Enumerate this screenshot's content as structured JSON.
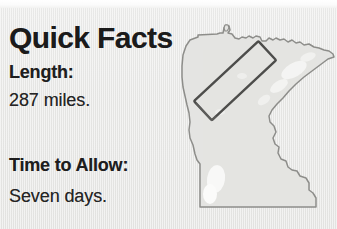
{
  "page": {
    "background_color": "#e9e9e7",
    "width": 337,
    "height": 229
  },
  "sidebar_panel": {
    "title": "Quick Facts",
    "fields": [
      {
        "label": "Length:",
        "value": "287 miles."
      },
      {
        "label": "Time to Allow:",
        "value": "Seven days."
      }
    ]
  },
  "map": {
    "name": "minnesota-state-outline",
    "fill_color": "#e4e4e2",
    "stroke_color": "#8a8a87",
    "highlight_box": {
      "name": "route-callout-box",
      "stroke_color": "#4a4a48",
      "rotation_deg": -43
    }
  }
}
